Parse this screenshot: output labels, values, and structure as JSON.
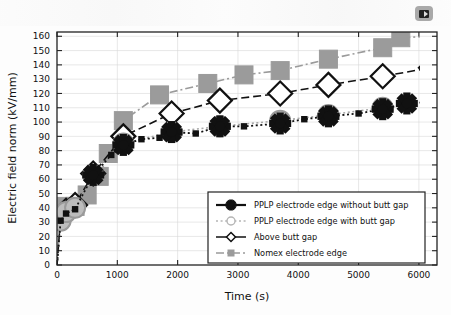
{
  "figure": {
    "corner_icon": "video-thumbnail-icon"
  },
  "chart_data": {
    "type": "line",
    "title": "",
    "xlabel": "Time (s)",
    "ylabel": "Electric field norm (kV/mm)",
    "xlim": [
      0,
      6300
    ],
    "ylim": [
      0,
      163
    ],
    "xticks": [
      0,
      1000,
      2000,
      3000,
      4000,
      5000,
      6000
    ],
    "yticks": [
      0,
      10,
      20,
      30,
      40,
      50,
      60,
      70,
      80,
      90,
      100,
      110,
      120,
      130,
      140,
      150,
      160
    ],
    "grid": true,
    "legend_position": "lower right",
    "series": [
      {
        "name": "PPLP electrode edge without butt gap",
        "marker": "star",
        "linestyle": "dotted",
        "color": "#111111",
        "x": [
          0,
          60,
          150,
          300,
          600,
          900,
          1100,
          1400,
          1700,
          1900,
          2300,
          2700,
          3100,
          3700,
          4100,
          4500,
          5000,
          5400,
          5800,
          6200
        ],
        "y": [
          0,
          31,
          36,
          39,
          63,
          77,
          84,
          88,
          89,
          93,
          92,
          97,
          97,
          99,
          102,
          104,
          106,
          109,
          113,
          114
        ]
      },
      {
        "name": "PPLP electrode edge with butt gap",
        "marker": "circle",
        "linestyle": "dotted",
        "color": "#a8a8a8",
        "x": [
          0,
          60,
          150,
          300,
          600,
          1100,
          1900,
          2700,
          3700,
          4500,
          5400
        ],
        "y": [
          0,
          31,
          37,
          40,
          63,
          85,
          93,
          97,
          101,
          105,
          110
        ]
      },
      {
        "name": "Above butt gap",
        "marker": "diamond",
        "linestyle": "dashed",
        "color": "#111111",
        "x": [
          0,
          60,
          150,
          300,
          600,
          1100,
          1900,
          2700,
          3700,
          4500,
          5400,
          6200
        ],
        "y": [
          0,
          33,
          38,
          42,
          64,
          90,
          106,
          115,
          120,
          126,
          132,
          138
        ]
      },
      {
        "name": "Nomex electrode edge",
        "marker": "square",
        "linestyle": "dashdot",
        "color": "#9b9b9b",
        "x": [
          0,
          60,
          150,
          300,
          500,
          700,
          850,
          1100,
          1700,
          2500,
          3100,
          3700,
          4500,
          5400,
          5700,
          6200
        ],
        "y": [
          0,
          36,
          41,
          41,
          49,
          62,
          78,
          101,
          119,
          127,
          133,
          136,
          144,
          152,
          159,
          160
        ]
      }
    ],
    "legend": [
      "PPLP electrode edge without butt gap",
      "PPLP electrode edge with butt gap",
      "Above butt gap",
      "Nomex electrode edge"
    ]
  }
}
